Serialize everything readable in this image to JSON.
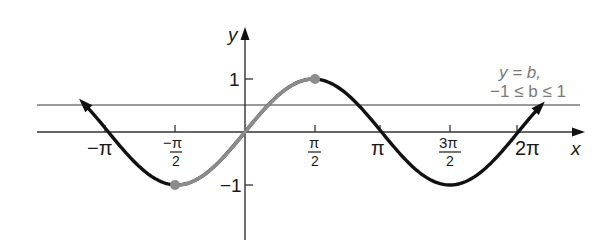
{
  "chart_data": {
    "type": "line",
    "title": "",
    "xlabel": "x",
    "ylabel": "y",
    "xlim": [
      -4.05,
      7.4
    ],
    "ylim": [
      -2.05,
      1.95
    ],
    "grid": false,
    "x_tick_labels": [
      "−π",
      "−π/2",
      "π/2",
      "π",
      "3π/2",
      "2π"
    ],
    "x_ticks": [
      -3.14159,
      -1.5708,
      1.5708,
      3.14159,
      4.71239,
      6.28319
    ],
    "y_tick_labels": [
      "1",
      "−1"
    ],
    "y_ticks": [
      1,
      -1
    ],
    "series": [
      {
        "name": "y = sin x",
        "color": "#111111",
        "function": "sin(x)",
        "domain": [
          -3.6,
          6.8
        ],
        "arrows": "both ends",
        "sample_x": [
          -3.14159,
          -1.5708,
          0,
          1.5708,
          3.14159,
          4.71239,
          6.28319
        ],
        "sample_y": [
          0,
          -1,
          0,
          1,
          0,
          -1,
          0
        ]
      },
      {
        "name": "restricted sine, −π/2 ≤ x ≤ π/2",
        "color": "#8c8c8c",
        "function": "sin(x)",
        "domain": [
          -1.5708,
          1.5708
        ],
        "endpoints": [
          [
            -1.5708,
            -1
          ],
          [
            1.5708,
            1
          ]
        ]
      },
      {
        "name": "y = b",
        "color": "#7a7a7a",
        "function": "b",
        "value": 0.5,
        "domain": [
          -3.8,
          7.2
        ]
      }
    ],
    "annotations": [
      {
        "text": "y = b,",
        "position": "upper right"
      },
      {
        "text": "−1 ≤ b ≤ 1",
        "position": "upper right"
      }
    ]
  },
  "labels": {
    "x_axis": "x",
    "y_axis": "y",
    "ticks_x": {
      "neg_pi": "−π",
      "neg_half_pi_num": "−π",
      "neg_half_pi_den": "2",
      "half_pi_num": "π",
      "half_pi_den": "2",
      "pi": "π",
      "three_half_pi_num": "3π",
      "three_half_pi_den": "2",
      "two_pi": "2π"
    },
    "ticks_y": {
      "one": "1",
      "neg_one": "−1"
    },
    "annotation_line1": "y = b,",
    "annotation_line2": "−1 ≤ b ≤ 1"
  }
}
